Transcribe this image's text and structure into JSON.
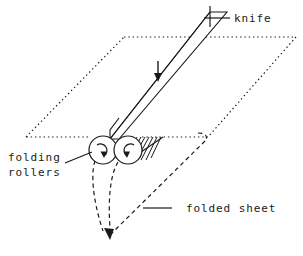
{
  "figure": {
    "background_color": "#ffffff",
    "ink_color": "#1a1a1a",
    "width": 303,
    "height": 256
  },
  "labels": {
    "knife": "knife",
    "folding_line1": "folding",
    "folding_line2": "rollers",
    "folded_sheet": "folded sheet"
  },
  "parts": {
    "knife": {
      "name": "knife",
      "line_style": "solid",
      "motion_arrow": "down-arrow-icon",
      "motion_direction": "down"
    },
    "sheet": {
      "name": "sheet",
      "line_style": "dotted",
      "shape": "parallelogram"
    },
    "folding_rollers": {
      "name": "folding rollers",
      "count": 2,
      "rotation_left": "clockwise",
      "rotation_right": "counter-clockwise",
      "line_style": "solid"
    },
    "folded_sheet": {
      "name": "folded sheet",
      "line_style": "dashed",
      "travel_direction": "down"
    },
    "nip_hatching": {
      "name": "nip hatching",
      "line_count": 8
    }
  }
}
